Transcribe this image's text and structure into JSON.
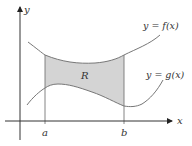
{
  "diagram": {
    "axes": {
      "x_label": "x",
      "y_label": "y"
    },
    "curves": [
      {
        "name": "f",
        "label": "y = f(x)",
        "role": "upper"
      },
      {
        "name": "g",
        "label": "y = g(x)",
        "role": "lower"
      }
    ],
    "bounds": {
      "left_label": "a",
      "right_label": "b"
    },
    "region": {
      "label": "R",
      "fill": "#d4d4d4"
    },
    "colors": {
      "axis": "#333333",
      "curve": "#777777",
      "region": "#d4d4d4"
    }
  }
}
